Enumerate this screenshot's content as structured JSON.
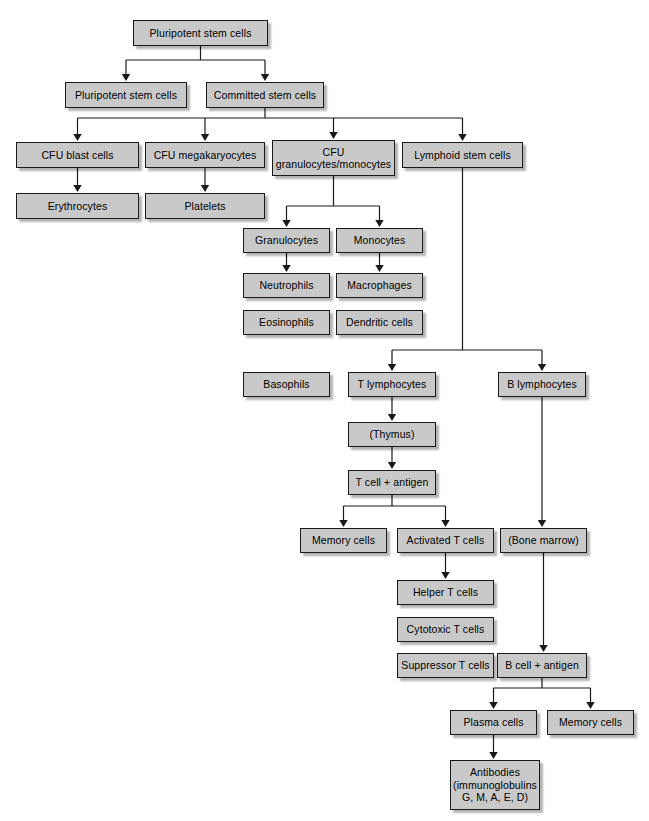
{
  "diagram": {
    "background_color": "#ffffff",
    "node_fill_color": "#c9c9c9",
    "node_border_color": "#1a1a1a",
    "edge_color": "#1a1a1a",
    "nodes": [
      {
        "id": "pluripotent_top",
        "label": "Pluripotent stem cells",
        "x": 133,
        "y": 20,
        "w": 135,
        "h": 26
      },
      {
        "id": "pluripotent_left",
        "label": "Pluripotent stem cells",
        "x": 65,
        "y": 82,
        "w": 122,
        "h": 26
      },
      {
        "id": "committed",
        "label": "Committed stem cells",
        "x": 206,
        "y": 82,
        "w": 118,
        "h": 26
      },
      {
        "id": "cfu_blast",
        "label": "CFU blast cells",
        "x": 16,
        "y": 142,
        "w": 123,
        "h": 26
      },
      {
        "id": "cfu_megakaryocytes",
        "label": "CFU megakaryocytes",
        "x": 145,
        "y": 142,
        "w": 120,
        "h": 26
      },
      {
        "id": "cfu_gran_mono",
        "label": "CFU\ngranulocytes/monocytes",
        "x": 272,
        "y": 140,
        "w": 123,
        "h": 36
      },
      {
        "id": "lymphoid",
        "label": "Lymphoid stem cells",
        "x": 402,
        "y": 142,
        "w": 121,
        "h": 26
      },
      {
        "id": "erythrocytes",
        "label": "Erythrocytes",
        "x": 16,
        "y": 193,
        "w": 123,
        "h": 26
      },
      {
        "id": "platelets",
        "label": "Platelets",
        "x": 145,
        "y": 193,
        "w": 120,
        "h": 26
      },
      {
        "id": "granulocytes",
        "label": "Granulocytes",
        "x": 243,
        "y": 228,
        "w": 87,
        "h": 25
      },
      {
        "id": "monocytes",
        "label": "Monocytes",
        "x": 336,
        "y": 228,
        "w": 87,
        "h": 25
      },
      {
        "id": "neutrophils",
        "label": "Neutrophils",
        "x": 243,
        "y": 273,
        "w": 87,
        "h": 25
      },
      {
        "id": "macrophages",
        "label": "Macrophages",
        "x": 336,
        "y": 273,
        "w": 87,
        "h": 25
      },
      {
        "id": "eosinophils",
        "label": "Eosinophils",
        "x": 243,
        "y": 310,
        "w": 87,
        "h": 25
      },
      {
        "id": "dendritic_cells",
        "label": "Dendritic cells",
        "x": 336,
        "y": 310,
        "w": 87,
        "h": 25
      },
      {
        "id": "basophils",
        "label": "Basophils",
        "x": 243,
        "y": 372,
        "w": 87,
        "h": 25
      },
      {
        "id": "t_lymphocytes",
        "label": "T lymphocytes",
        "x": 348,
        "y": 372,
        "w": 88,
        "h": 25
      },
      {
        "id": "b_lymphocytes",
        "label": "B lymphocytes",
        "x": 498,
        "y": 372,
        "w": 88,
        "h": 25
      },
      {
        "id": "thymus",
        "label": "(Thymus)",
        "x": 348,
        "y": 422,
        "w": 88,
        "h": 25
      },
      {
        "id": "t_cell_antigen",
        "label": "T cell + antigen",
        "x": 348,
        "y": 470,
        "w": 88,
        "h": 25
      },
      {
        "id": "memory_cells_t",
        "label": "Memory cells",
        "x": 300,
        "y": 528,
        "w": 87,
        "h": 25
      },
      {
        "id": "activated_t_cells",
        "label": "Activated T cells",
        "x": 397,
        "y": 528,
        "w": 97,
        "h": 25
      },
      {
        "id": "bone_marrow",
        "label": "(Bone marrow)",
        "x": 500,
        "y": 528,
        "w": 87,
        "h": 25
      },
      {
        "id": "helper_t_cells",
        "label": "Helper T cells",
        "x": 397,
        "y": 580,
        "w": 97,
        "h": 25
      },
      {
        "id": "cytotoxic_t_cells",
        "label": "Cytotoxic T cells",
        "x": 397,
        "y": 617,
        "w": 97,
        "h": 25
      },
      {
        "id": "suppressor_t_cells",
        "label": "Suppressor T cells",
        "x": 397,
        "y": 653,
        "w": 97,
        "h": 25
      },
      {
        "id": "b_cell_antigen",
        "label": "B cell + antigen",
        "x": 497,
        "y": 653,
        "w": 90,
        "h": 25
      },
      {
        "id": "plasma_cells",
        "label": "Plasma cells",
        "x": 450,
        "y": 710,
        "w": 87,
        "h": 25
      },
      {
        "id": "memory_cells_b",
        "label": "Memory cells",
        "x": 547,
        "y": 710,
        "w": 87,
        "h": 25
      },
      {
        "id": "antibodies",
        "label": "Antibodies\n(immunoglobulins\nG, M, A, E, D)",
        "x": 450,
        "y": 760,
        "w": 90,
        "h": 50
      }
    ],
    "edges": [
      {
        "from": "pluripotent_top",
        "to": "pluripotent_left",
        "type": "split-down"
      },
      {
        "from": "pluripotent_top",
        "to": "committed",
        "type": "split-down"
      },
      {
        "from": "committed",
        "to": "cfu_blast",
        "type": "split-down"
      },
      {
        "from": "committed",
        "to": "cfu_megakaryocytes",
        "type": "split-down"
      },
      {
        "from": "committed",
        "to": "cfu_gran_mono",
        "type": "split-down"
      },
      {
        "from": "committed",
        "to": "lymphoid",
        "type": "split-down"
      },
      {
        "from": "cfu_blast",
        "to": "erythrocytes",
        "type": "straight-down"
      },
      {
        "from": "cfu_megakaryocytes",
        "to": "platelets",
        "type": "straight-down"
      },
      {
        "from": "cfu_gran_mono",
        "to": "granulocytes",
        "type": "split-down"
      },
      {
        "from": "cfu_gran_mono",
        "to": "monocytes",
        "type": "split-down"
      },
      {
        "from": "granulocytes",
        "to": "neutrophils",
        "type": "straight-down"
      },
      {
        "from": "monocytes",
        "to": "macrophages",
        "type": "straight-down"
      },
      {
        "from": "lymphoid",
        "to": "t_lymphocytes",
        "type": "split-down"
      },
      {
        "from": "lymphoid",
        "to": "b_lymphocytes",
        "type": "split-down"
      },
      {
        "from": "t_lymphocytes",
        "to": "thymus",
        "type": "straight-down"
      },
      {
        "from": "thymus",
        "to": "t_cell_antigen",
        "type": "straight-down"
      },
      {
        "from": "t_cell_antigen",
        "to": "memory_cells_t",
        "type": "split-down"
      },
      {
        "from": "t_cell_antigen",
        "to": "activated_t_cells",
        "type": "split-down"
      },
      {
        "from": "b_lymphocytes",
        "to": "bone_marrow",
        "type": "straight-down"
      },
      {
        "from": "activated_t_cells",
        "to": "helper_t_cells",
        "type": "straight-down"
      },
      {
        "from": "bone_marrow",
        "to": "b_cell_antigen",
        "type": "straight-down"
      },
      {
        "from": "b_cell_antigen",
        "to": "plasma_cells",
        "type": "split-down"
      },
      {
        "from": "b_cell_antigen",
        "to": "memory_cells_b",
        "type": "split-down"
      },
      {
        "from": "plasma_cells",
        "to": "antibodies",
        "type": "straight-down"
      }
    ]
  }
}
